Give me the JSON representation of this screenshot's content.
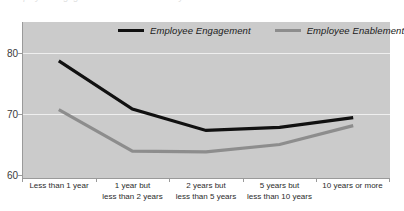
{
  "chart_data": {
    "type": "line",
    "title": "",
    "xlabel": "",
    "ylabel": "",
    "ylim": [
      60,
      85
    ],
    "yticks": [
      60,
      70,
      80
    ],
    "grid": true,
    "legend_position": "top-center",
    "categories": [
      "Less than 1 year",
      "1 year but less than 2 years",
      "2 years but less than 5 years",
      "5 years but less than 10 years",
      "10 years or more"
    ],
    "series": [
      {
        "name": "Employee Engagement",
        "color": "#111111",
        "values": [
          78.7,
          70.8,
          67.3,
          67.8,
          69.4
        ]
      },
      {
        "name": "Employee Enablement",
        "color": "#8d8d8d",
        "values": [
          70.7,
          63.9,
          63.8,
          65.0,
          68.1
        ]
      }
    ]
  },
  "title_sliver": "Employee Engagement and Enablement by Tenure",
  "axis": {
    "y_tick_labels": [
      "80",
      "70",
      "60"
    ],
    "x_tick_labels": [
      [
        "Less than 1 year",
        ""
      ],
      [
        "1 year but",
        "less than 2 years"
      ],
      [
        "2 years but",
        "less than 5 years"
      ],
      [
        "5 years but",
        "less than 10 years"
      ],
      [
        "10 years or more",
        ""
      ]
    ]
  },
  "legend": {
    "items": [
      {
        "label": "Employee Engagement",
        "color": "#111111"
      },
      {
        "label": "Employee Enablement",
        "color": "#8d8d8d"
      }
    ]
  },
  "colors": {
    "plot_background": "#cbcbcb",
    "gridline": "#efefef",
    "axis": "#9a9a9a",
    "engagement": "#111111",
    "enablement": "#8d8d8d"
  }
}
